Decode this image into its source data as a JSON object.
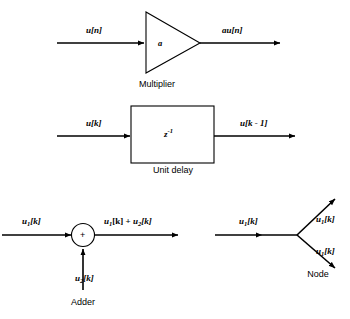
{
  "diagram": {
    "stroke_color": "#000000",
    "background_color": "#ffffff",
    "blocks": [
      {
        "id": "multiplier",
        "caption": "Multiplier",
        "shape": "triangle",
        "gain_label": "a",
        "input_label": "u[n]",
        "output_label": "au[n]"
      },
      {
        "id": "unit-delay",
        "caption": "Unit delay",
        "shape": "rectangle",
        "operator_base": "z",
        "operator_exponent": "-1",
        "input_label": "u[k]",
        "output_label": "u[k - 1]"
      },
      {
        "id": "adder",
        "caption": "Adder",
        "shape": "circle",
        "operator_symbol": "+",
        "input_label_1": "u",
        "input_sub_1": "1",
        "input_tail_1": "[k]",
        "input_label_2": "u",
        "input_sub_2": "2",
        "input_tail_2": "[k]",
        "output_base_1": "u",
        "output_sub_1": "1",
        "output_mid": "[k] + ",
        "output_base_2": "u",
        "output_sub_2": "2",
        "output_tail_2": "[k]"
      },
      {
        "id": "node",
        "caption": "Node",
        "shape": "vertex",
        "input_base": "u",
        "input_sub": "1",
        "input_tail": "[k]",
        "branch_upper_base": "u",
        "branch_upper_sub": "1",
        "branch_upper_tail": "[k]",
        "branch_lower_base": "u",
        "branch_lower_sub": "1",
        "branch_lower_tail": "[k]"
      }
    ]
  }
}
